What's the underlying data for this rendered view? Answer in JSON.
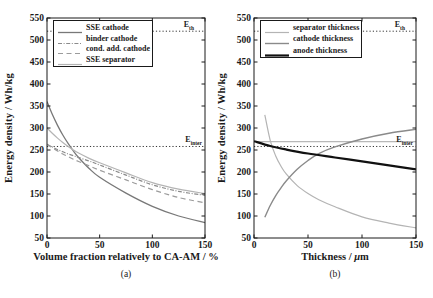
{
  "figure": {
    "width": 433,
    "height": 298,
    "background": "#ffffff",
    "frame_color": "#1a1a1a",
    "panels": [
      {
        "caption": "(a)",
        "e_labels": [
          {
            "main": "E",
            "sub": "th"
          },
          {
            "main": "E",
            "sub": "inter"
          }
        ]
      },
      {
        "caption": "(b)",
        "xlabel_pre": "Thickness / ",
        "xlabel_mu": "μ",
        "xlabel_post": "m",
        "e_labels": [
          {
            "main": "E",
            "sub": "th"
          },
          {
            "main": "E",
            "sub": "inter"
          }
        ]
      }
    ]
  },
  "chart_data": [
    {
      "type": "line",
      "title": "",
      "xlabel": "Volume fraction relatively to CA-AM / %",
      "ylabel": "Energy density / Wh/kg",
      "xlim": [
        0,
        150
      ],
      "ylim": [
        50,
        550
      ],
      "xticks": [
        0,
        50,
        100,
        150
      ],
      "yticks": [
        50,
        100,
        150,
        200,
        250,
        300,
        350,
        400,
        450,
        500,
        550
      ],
      "grid": false,
      "legend_position": "top-left",
      "reference_lines": [
        {
          "label": "E_th",
          "value": 520,
          "style": "dotted",
          "color": "#333333",
          "width": 1
        },
        {
          "label": "E_inter",
          "value": 258,
          "style": "dotted",
          "color": "#333333",
          "width": 1
        }
      ],
      "series": [
        {
          "name": "SSE cathode",
          "style": "solid",
          "color": "#787878",
          "width": 1.3,
          "x": [
            0,
            5,
            10,
            15,
            20,
            25,
            30,
            40,
            50,
            75,
            100,
            125,
            150
          ],
          "y": [
            360,
            331,
            306,
            284,
            265,
            248,
            233,
            208,
            188,
            152,
            122,
            100,
            85
          ]
        },
        {
          "name": "binder cathode",
          "style": "dashdot",
          "color": "#8a8a8a",
          "width": 1.2,
          "x": [
            0,
            5,
            10,
            15,
            20,
            25,
            30,
            40,
            50,
            75,
            100,
            125,
            150
          ],
          "y": [
            263,
            257,
            251,
            246,
            241,
            237,
            233,
            225,
            216,
            193,
            171,
            156,
            147
          ]
        },
        {
          "name": "cond. add. cathode",
          "style": "dashed",
          "color": "#9b9b9b",
          "width": 1.2,
          "x": [
            0,
            5,
            10,
            15,
            20,
            25,
            30,
            40,
            50,
            75,
            100,
            125,
            150
          ],
          "y": [
            263,
            255,
            248,
            241,
            235,
            229,
            224,
            214,
            204,
            182,
            160,
            142,
            130
          ]
        },
        {
          "name": "SSE separator",
          "style": "solid",
          "color": "#b4b4b4",
          "width": 1.2,
          "x": [
            0,
            5,
            10,
            15,
            20,
            25,
            30,
            40,
            50,
            75,
            100,
            125,
            150
          ],
          "y": [
            300,
            288,
            277,
            267,
            258,
            250,
            243,
            231,
            221,
            198,
            176,
            161,
            151
          ]
        }
      ]
    },
    {
      "type": "line",
      "title": "",
      "xlabel": "Thickness / μm",
      "ylabel": "Energy density / Wh/kg",
      "xlim": [
        0,
        150
      ],
      "ylim": [
        50,
        550
      ],
      "xticks": [
        0,
        50,
        100,
        150
      ],
      "yticks": [
        50,
        100,
        150,
        200,
        250,
        300,
        350,
        400,
        450,
        500,
        550
      ],
      "grid": false,
      "legend_position": "top-left",
      "reference_lines": [
        {
          "label": "E_th",
          "value": 520,
          "style": "dotted",
          "color": "#333333",
          "width": 1
        },
        {
          "label": "E_inter",
          "value": 258,
          "style": "dotted",
          "color": "#333333",
          "width": 1
        },
        {
          "label": "",
          "value": 269,
          "style": "solid",
          "color": "#b8b8b8",
          "width": 1.1
        }
      ],
      "series": [
        {
          "name": "separator thickness",
          "style": "solid",
          "color": "#b4b4b4",
          "width": 1.2,
          "x": [
            10,
            15,
            20,
            25,
            30,
            40,
            50,
            60,
            75,
            100,
            125,
            150
          ],
          "y": [
            330,
            272,
            237,
            213,
            195,
            169,
            151,
            137,
            121,
            98,
            84,
            73
          ]
        },
        {
          "name": "cathode thickness",
          "style": "solid",
          "color": "#8a8a8a",
          "width": 1.4,
          "x": [
            10,
            15,
            20,
            25,
            30,
            40,
            50,
            60,
            75,
            100,
            125,
            150
          ],
          "y": [
            97,
            124,
            146,
            164,
            180,
            206,
            226,
            242,
            257,
            275,
            288,
            297
          ]
        },
        {
          "name": "anode thickness",
          "style": "solid",
          "color": "#111111",
          "width": 2.2,
          "x": [
            0,
            15,
            30,
            50,
            75,
            100,
            125,
            150
          ],
          "y": [
            270,
            259,
            251,
            242,
            233,
            224,
            215,
            206
          ]
        }
      ]
    }
  ]
}
